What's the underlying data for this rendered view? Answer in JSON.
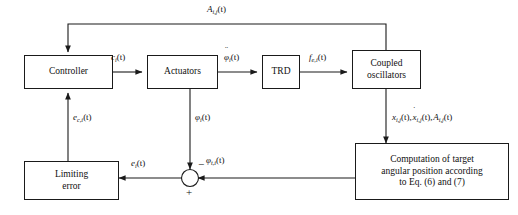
{
  "diagram": {
    "stroke_color": "#1a1a1a",
    "background": "#ffffff",
    "blocks": [
      {
        "id": "controller",
        "label": "Controller",
        "lines": [
          "Controller"
        ]
      },
      {
        "id": "actuators",
        "label": "Actuators",
        "lines": [
          "Actuators"
        ]
      },
      {
        "id": "trd",
        "label": "TRD",
        "lines": [
          "TRD"
        ]
      },
      {
        "id": "coupled-oscillators",
        "label": "Coupled oscillators",
        "lines": [
          "Coupled",
          "oscillators"
        ]
      },
      {
        "id": "computation",
        "label": "Computation of target angular position according to Eq. (6) and (7)",
        "lines": [
          "Computation of target",
          "angular position according",
          "to Eq. (6) and (7)"
        ]
      },
      {
        "id": "limiting-error",
        "label": "Limiting error",
        "lines": [
          "Limiting",
          "error"
        ]
      }
    ],
    "signals": {
      "feedback_top": "A",
      "feedback_top_sub": "i,j",
      "feedback_top_arg": "(t)",
      "controller_out": "c",
      "controller_out_sub": "i",
      "controller_out_arg": "(t)",
      "actuator_out": "φ",
      "actuator_out_sub": "i",
      "actuator_out_arg": "(t)",
      "trd_out": "f",
      "trd_out_sub": "e,i",
      "trd_out_arg": "(t)",
      "oscillator_states_1": "x",
      "oscillator_states_1_sub": "i,j",
      "oscillator_states_2": "x",
      "oscillator_states_2_sub": "i,j",
      "oscillator_states_3": "A",
      "oscillator_states_3_sub": "i,j",
      "oscillator_states_arg": "(t)",
      "error_to_controller": "e",
      "error_to_controller_sub": "c,i",
      "error_to_controller_arg": "(t)",
      "actuator_feedback": "φ",
      "actuator_feedback_sub": "i",
      "actuator_feedback_arg": "(t)",
      "sum_out": "e",
      "sum_out_sub": "i",
      "sum_out_arg": "(t)",
      "target_angle": "φ",
      "target_angle_sub": "t,i",
      "target_angle_arg": "(t)",
      "sum_minus": "−",
      "sum_plus": "+"
    },
    "junction": {
      "name": "summing-junction",
      "shape": "circle"
    }
  }
}
